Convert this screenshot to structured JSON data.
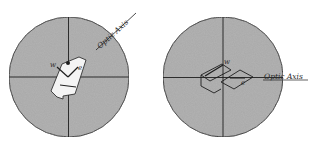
{
  "figure": {
    "left_diagram": {
      "axis_label": "Optic Axis",
      "labels": {
        "w": "w",
        "e": "e"
      },
      "center": [
        69,
        77
      ],
      "radius": 60,
      "axis_angle_deg": -35
    },
    "right_diagram": {
      "axis_label": "Optic Axis",
      "labels": {
        "w": "w",
        "e": "e"
      },
      "center": [
        223,
        77
      ],
      "radius": 60,
      "axis_angle_deg": 0
    },
    "colors": {
      "field": "#a9a9a9",
      "line": "#1e1e1e",
      "crystal": "#f4f4f4"
    }
  }
}
